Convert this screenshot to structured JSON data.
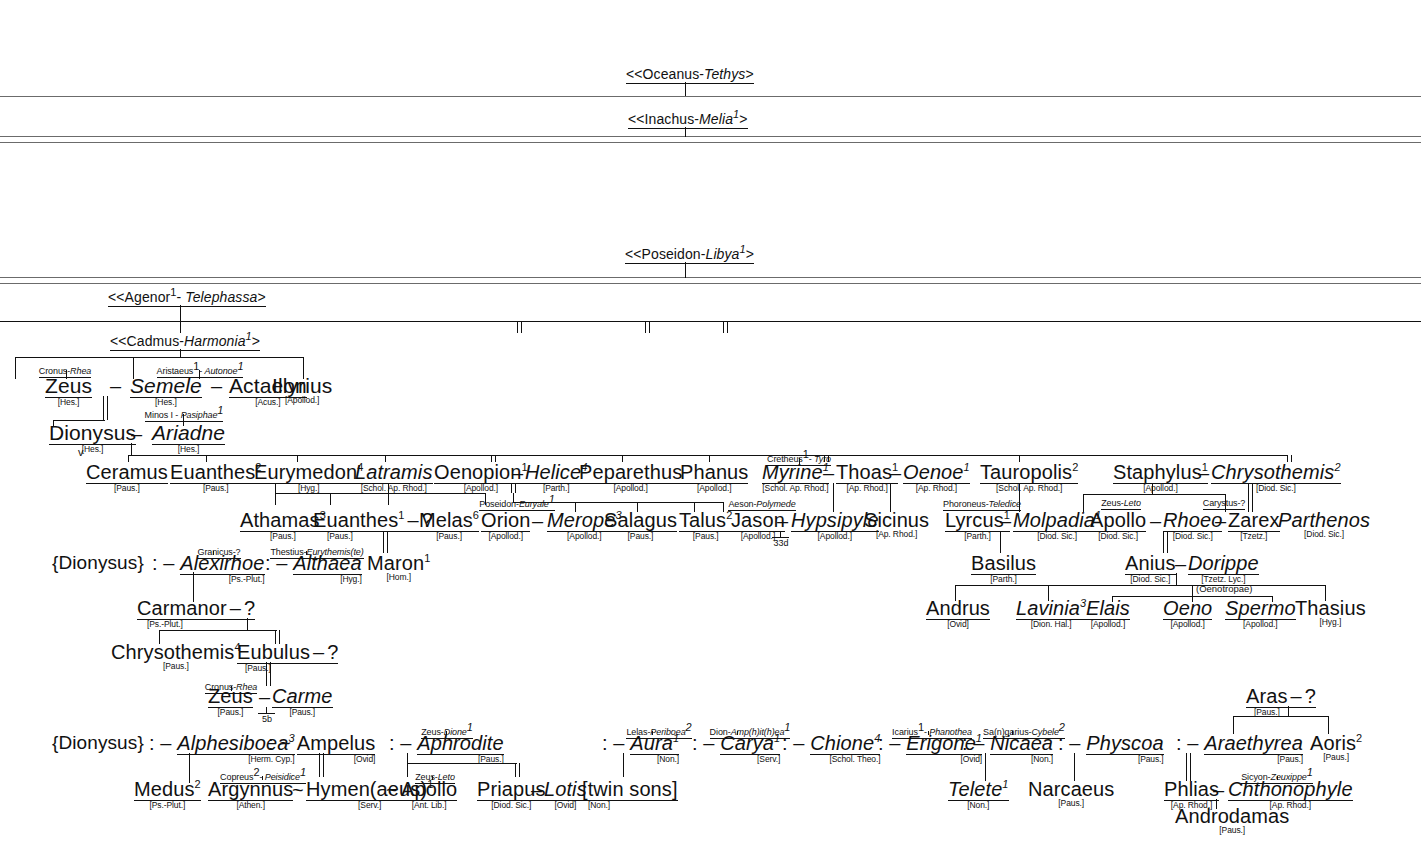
{
  "ancestors": [
    {
      "id": "oceanus",
      "text": "<<Oceanus-",
      "spouse": "Tethys",
      "tail": ">"
    },
    {
      "id": "inachus",
      "text": "<<Inachus-",
      "spouse": "Melia",
      "sup": "1",
      "tail": ">"
    },
    {
      "id": "poseidon",
      "text": "<<Poseidon-",
      "spouse": "Libya",
      "sup": "1",
      "tail": ">"
    },
    {
      "id": "agenor",
      "text": "<<Agenor",
      "sup1": "1",
      "mid": "- ",
      "spouse": "Telephassa",
      "tail": ">"
    },
    {
      "id": "cadmus",
      "text": "<<Cadmus-",
      "spouse": "Harmonia",
      "sup": "1",
      "tail": ">"
    }
  ],
  "gen_cadmus": [
    {
      "name": "Zeus",
      "src": "[Hes.]",
      "parents": "Cronus-",
      "parents_ital": "Rhea"
    },
    {
      "name": "Semele",
      "src": "[Hes.]",
      "italic": true
    },
    {
      "name": "Actaeon",
      "src": "[Acus.]",
      "parents": "Aristaeus",
      "parents_sup": "1",
      "parents_mid": "- ",
      "parents_ital": "Autonoe",
      "parents_ital_sup": "1"
    },
    {
      "name": "Illyrius",
      "src": "[Apollod.]"
    },
    {
      "name": "Corybas",
      "src": "[Diod. Sic.]",
      "parents": "Iasion-",
      "parents_ital": "Cybele",
      "parents_ital_sup": "1"
    },
    {
      "name": "Thebe",
      "sup": "3",
      "src": "[Diod. Sic.]",
      "italic": true
    },
    {
      "name": "Pyrodes",
      "src": "[Pliny]"
    },
    {
      "name": "Cilix",
      "src": "[Herod.]",
      "mate": "?"
    },
    {
      "name": "Electra",
      "sup": "4",
      "src": "[Paus.]",
      "italic": true
    },
    {
      "name": "Thasus",
      "src": "[Schol. Eur.]"
    }
  ],
  "dionysus_ariadne": {
    "left": "Dionysus",
    "left_src": "[Hes.]",
    "right": "Ariadne",
    "right_src": "[Hes.]",
    "right_parents": "Minos I - ",
    "right_parents_ital": "Pasiphae",
    "right_parents_sup": "1",
    "marker": "v"
  },
  "children_row": [
    {
      "name": "Ceramus",
      "src": "[Paus.]"
    },
    {
      "name": "Euanthes",
      "sup": "2",
      "src": "[Paus.]"
    },
    {
      "name": "Eurymedon",
      "sup": "4",
      "src": "[Hyg.]"
    },
    {
      "name": "Latramis",
      "src": "[Schol. Ap. Rhod.]",
      "italic": true
    },
    {
      "name": "Oenopion",
      "sup": "1",
      "src": "[Apollod.]"
    },
    {
      "name": "Helice",
      "sup": "4",
      "src": "[Parth.]",
      "italic": true
    },
    {
      "name": "Peparethus",
      "src": "[Apollod.]"
    },
    {
      "name": "Phanus",
      "src": "[Apollod.]"
    },
    {
      "name": "Myrine",
      "sup": "1",
      "src": "[Schol. Ap. Rhod.]",
      "italic": true,
      "parents": "Cretheus",
      "parents_sup": "1",
      "parents_mid": "- ",
      "parents_ital": "Tyro"
    },
    {
      "name": "Thoas",
      "sup": "1",
      "src": "[Ap. Rhod.]"
    },
    {
      "name": "Oenoe",
      "sup": "1",
      "src": "[Ap. Rhod.]",
      "italic": true
    },
    {
      "name": "Tauropolis",
      "sup": "2",
      "src": "[Schol. Ap. Rhod.]"
    },
    {
      "name": "Staphylus",
      "sup": "1",
      "src": "[Apollod.]"
    },
    {
      "name": "Chrysothemis",
      "sup": "2",
      "src": "[Diod. Sic.]",
      "italic": true
    }
  ],
  "grandchildren_row": [
    {
      "name": "Athamas",
      "sup": "3",
      "src": "[Paus.]"
    },
    {
      "name": "Euanthes",
      "sup": "1",
      "src": "[Paus.]",
      "mate": "?"
    },
    {
      "name": "Melas",
      "sup": "6",
      "src": "[Paus.]"
    },
    {
      "name": "Orion",
      "src": "[Apollod.]",
      "parents": "Poseidon-",
      "parents_ital": "Euryale",
      "parents_ital_sup": "1"
    },
    {
      "name": "Merope",
      "sup": "3",
      "src": "[Apollod.]",
      "italic": true
    },
    {
      "name": "Salagus",
      "src": "[Paus.]"
    },
    {
      "name": "Talus",
      "sup": "2",
      "src": "[Paus.]"
    },
    {
      "name": "Jason",
      "src": "[Apollod.]",
      "parents": "Aeson-",
      "parents_ital": "Polymede",
      "ref": "33d"
    },
    {
      "name": "Hypsipyle",
      "src": "[Apollod.]",
      "italic": true
    },
    {
      "name": "Sicinus",
      "src": "[Ap. Rhod.]"
    },
    {
      "name": "Lyrcus",
      "sup": "1",
      "src": "[Parth.]",
      "parents": "Phoroneus-",
      "parents_ital": "Teledice"
    },
    {
      "name": "Molpadia",
      "sup": "1",
      "src": "[Diod. Sic.]",
      "italic": true
    },
    {
      "name": "Apollo",
      "src": "[Diod. Sic.]",
      "parents": "Zeus-",
      "parents_ital": "Leto"
    },
    {
      "name": "Rhoeo",
      "src": "[Diod. Sic.]",
      "italic": true
    },
    {
      "name": "Zarex",
      "src": "[Tzetz.]",
      "parents": "Carystus-?"
    },
    {
      "name": "Parthenos",
      "src": "[Diod. Sic.]",
      "italic": true
    }
  ],
  "dionysus_consorts_1": [
    {
      "brace": "{Dionysus}"
    },
    {
      "prefix": ": –",
      "name": "Alexirhoe",
      "src": "[Ps.-Plut.]",
      "italic": true,
      "parents": "Granicus-?"
    },
    {
      "prefix": ": –",
      "name": "Althaea",
      "src": "[Hyg.]",
      "italic": true,
      "parents": "Thestius-",
      "parents_ital": "Eurythemis(te)"
    },
    {
      "name": "Maron",
      "sup": "1",
      "src": "[Hom.]"
    }
  ],
  "anius_branch": {
    "basilus": {
      "name": "Basilus",
      "src": "[Parth.]"
    },
    "anius": {
      "name": "Anius",
      "src": "[Diod. Sic.]"
    },
    "dorippe": {
      "name": "Dorippe",
      "src": "[Tzetz. Lyc.]",
      "italic": true
    },
    "group_label": "(Oenotropae)",
    "children": [
      {
        "name": "Andrus",
        "src": "[Ovid]"
      },
      {
        "name": "Lavinia",
        "sup": "3",
        "src": "[Dion. Hal.]",
        "italic": true
      },
      {
        "name": "Elais",
        "src": "[Apollod.]",
        "italic": true
      },
      {
        "name": "Oeno",
        "src": "[Apollod.]",
        "italic": true
      },
      {
        "name": "Spermo",
        "src": "[Apollod.]",
        "italic": true
      },
      {
        "name": "Thasius",
        "src": "[Hyg.]"
      }
    ]
  },
  "carmanor_branch": {
    "carmanor": {
      "name": "Carmanor",
      "src": "[Ps.-Plut.]",
      "mate": "?"
    },
    "chrysothemis": {
      "name": "Chrysothemis",
      "sup": "4",
      "src": "[Paus.]"
    },
    "eubulus": {
      "name": "Eubulus",
      "src": "[Paus.]",
      "mate": "?"
    },
    "zeus": {
      "name": "Zeus",
      "src": "[Paus.]",
      "parents": "Cronus-",
      "parents_ital": "Rhea"
    },
    "carme": {
      "name": "Carme",
      "src": "[Paus.]",
      "italic": true
    },
    "ref": "5b"
  },
  "dionysus_consorts_2": [
    {
      "brace": "{Dionysus}"
    },
    {
      "prefix": ": –",
      "name": "Alphesiboea",
      "sup": "3",
      "src": "[Herm. Cyp.]",
      "italic": true
    },
    {
      "prefix": ": ~",
      "name": "Ampelus",
      "src": "[Ovid]"
    },
    {
      "prefix": ": –",
      "name": "Aphrodite",
      "src": "[Paus.]",
      "italic": true,
      "parents": "Zeus-",
      "parents_ital": "Dione",
      "parents_ital_sup": "1"
    },
    {
      "prefix": ": –",
      "name": "Aura",
      "sup": "1",
      "src": "[Non.]",
      "italic": true,
      "parents": "Lelas-",
      "parents_ital": "Periboea",
      "parents_ital_sup": "2"
    },
    {
      "prefix": ": –",
      "name": "Carya",
      "sup": "1",
      "src": "[Serv.]",
      "italic": true,
      "parents": "Dion-",
      "parents_ital": "Amp(h)it(h)ea",
      "parents_ital_sup": "1"
    },
    {
      "prefix": ": –",
      "name": "Chione",
      "sup": "4",
      "src": "[Schol. Theo.]",
      "italic": true
    },
    {
      "prefix": ": –",
      "name": "Erigone",
      "sup": "1",
      "src": "[Ovid]",
      "italic": true,
      "parents": "Icarius",
      "parents_sup": "1",
      "parents_mid": "- ",
      "parents_ital": "Phanothea"
    },
    {
      "prefix": ": –",
      "name": "Nicaea",
      "src": "[Non.]",
      "italic": true,
      "parents": "Sa(n)garius-",
      "parents_ital": "Cybele",
      "parents_ital_sup": "2"
    },
    {
      "prefix": ": –",
      "name": "Physcoa",
      "src": "[Paus.]",
      "italic": true
    },
    {
      "prefix": ": –",
      "name": "Araethyrea",
      "src": "[Paus.]",
      "italic": true
    },
    {
      "name": "Aoris",
      "sup": "2",
      "src": "[Paus.]"
    }
  ],
  "bottom_row": [
    {
      "name": "Medus",
      "sup": "2",
      "src": "[Ps.-Plut.]"
    },
    {
      "name": "Argynnus",
      "src": "[Athen.]",
      "parents": "Copreus",
      "parents_sup": "2",
      "parents_mid": "- ",
      "parents_ital": "Peisidice",
      "parents_ital_sup": "1"
    },
    {
      "name": "Hymen(aeus)",
      "sup": "1",
      "src": "[Serv.]"
    },
    {
      "name": "Apollo",
      "src": "[Ant. Lib.]",
      "parents": "Zeus-",
      "parents_ital": "Leto"
    },
    {
      "name": "Priapus",
      "src": "[Diod. Sic.]"
    },
    {
      "name": "Lotis",
      "src": "[Ovid]",
      "italic": true
    },
    {
      "name": "[twin sons]",
      "src": "[Non.]"
    },
    {
      "name": "Telete",
      "sup": "1",
      "src": "[Non.]",
      "italic": true
    },
    {
      "name": "Narcaeus",
      "src": "[Paus.]"
    },
    {
      "name": "Phlias",
      "src": "[Ap. Rhod.]"
    },
    {
      "name": "Chthonophyle",
      "src": "[Ap. Rhod.]",
      "italic": true,
      "parents": "Sicyon-",
      "parents_ital": "Zeuxippe",
      "parents_ital_sup": "1"
    },
    {
      "name": "Androdamas",
      "src": "[Paus.]"
    }
  ],
  "aras": {
    "name": "Aras",
    "src": "[Paus.]",
    "mate": "?"
  },
  "connectors": {
    "tilde": "~",
    "dash": "–",
    "question": "?"
  }
}
